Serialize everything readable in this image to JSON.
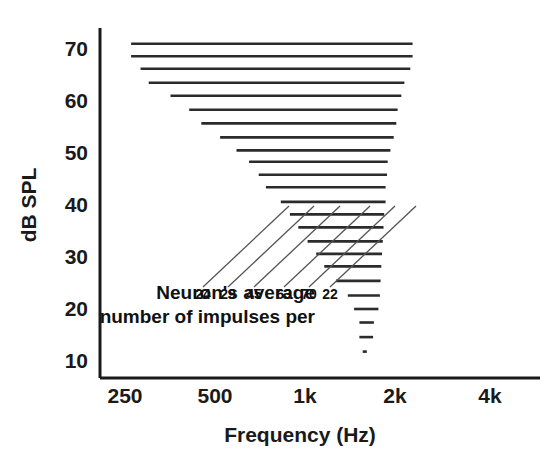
{
  "chart_data": {
    "type": "line",
    "title": "",
    "xlabel": "Frequency (Hz)",
    "ylabel": "dB SPL",
    "grid": false,
    "legend": null,
    "xticks": [
      "250",
      "500",
      "1k",
      "2k",
      "4k"
    ],
    "xtick_values": [
      250,
      500,
      1000,
      2000,
      4000
    ],
    "xscale": "log",
    "xlim": [
      250,
      4000
    ],
    "yticks": [
      "70",
      "60",
      "50",
      "40",
      "30",
      "20",
      "10"
    ],
    "ytick_values": [
      70,
      60,
      50,
      40,
      30,
      20,
      10
    ],
    "ylim": [
      8,
      74
    ],
    "series_description": "Horizontal response-area bars: each bar spans the frequency range over which one neuron responded at a given sound level (dB SPL).",
    "bars": [
      {
        "db": 71.0,
        "f_low": 262,
        "f_high": 2290
      },
      {
        "db": 68.6,
        "f_low": 262,
        "f_high": 2290
      },
      {
        "db": 66.2,
        "f_low": 282,
        "f_high": 2250
      },
      {
        "db": 63.5,
        "f_low": 300,
        "f_high": 2150
      },
      {
        "db": 61.0,
        "f_low": 355,
        "f_high": 2100
      },
      {
        "db": 58.3,
        "f_low": 410,
        "f_high": 2040
      },
      {
        "db": 55.7,
        "f_low": 450,
        "f_high": 2020
      },
      {
        "db": 53.0,
        "f_low": 520,
        "f_high": 1980
      },
      {
        "db": 50.5,
        "f_low": 590,
        "f_high": 1930
      },
      {
        "db": 48.3,
        "f_low": 650,
        "f_high": 1890
      },
      {
        "db": 45.8,
        "f_low": 700,
        "f_high": 1880
      },
      {
        "db": 43.4,
        "f_low": 740,
        "f_high": 1860
      },
      {
        "db": 40.6,
        "f_low": 830,
        "f_high": 1860
      },
      {
        "db": 38.2,
        "f_low": 890,
        "f_high": 1840
      },
      {
        "db": 35.7,
        "f_low": 950,
        "f_high": 1830
      },
      {
        "db": 33.0,
        "f_low": 1020,
        "f_high": 1820
      },
      {
        "db": 30.6,
        "f_low": 1090,
        "f_high": 1810
      },
      {
        "db": 28.2,
        "f_low": 1160,
        "f_high": 1800
      },
      {
        "db": 25.4,
        "f_low": 1270,
        "f_high": 1790
      },
      {
        "db": 22.6,
        "f_low": 1390,
        "f_high": 1780
      },
      {
        "db": 20.0,
        "f_low": 1460,
        "f_high": 1760
      },
      {
        "db": 17.4,
        "f_low": 1520,
        "f_high": 1700
      },
      {
        "db": 14.6,
        "f_low": 1520,
        "f_high": 1690
      },
      {
        "db": 11.8,
        "f_low": 1560,
        "f_high": 1610
      }
    ],
    "annotation_labels": [
      "24",
      "29",
      "45",
      "63",
      "70",
      "22"
    ],
    "annotation_note_line1": "Neuron's average",
    "annotation_note_line2": "number of impulses per",
    "leader_lines": [
      {
        "label": "24",
        "from_x": 203,
        "from_y": 287,
        "to_x": 289,
        "to_y": 206
      },
      {
        "label": "29",
        "from_x": 228,
        "from_y": 287,
        "to_x": 314,
        "to_y": 206
      },
      {
        "label": "45",
        "from_x": 254,
        "from_y": 287,
        "to_x": 340,
        "to_y": 206
      },
      {
        "label": "63",
        "from_x": 284,
        "from_y": 287,
        "to_x": 370,
        "to_y": 206
      },
      {
        "label": "70",
        "from_x": 309,
        "from_y": 287,
        "to_x": 395,
        "to_y": 206
      },
      {
        "label": "22",
        "from_x": 330,
        "from_y": 287,
        "to_x": 416,
        "to_y": 206
      }
    ]
  },
  "axis": {
    "x_title": "Frequency (Hz)",
    "y_title": "dB SPL"
  },
  "colors": {
    "background": "#ffffff",
    "ink": "#1a1a1a",
    "line": "#2b2b2b",
    "leader": "#555555"
  }
}
